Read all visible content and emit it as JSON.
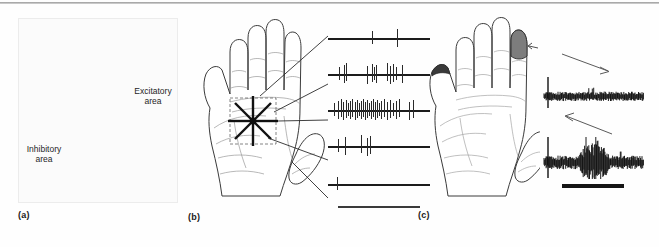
{
  "figure": {
    "panels": [
      {
        "id": "a",
        "label": "(a)",
        "description": "cat forelimb with excitatory and inhibitory receptive field areas",
        "annotations": [
          {
            "name": "excitatory-area-label",
            "text_line1": "Excitatory",
            "text_line2": "area"
          },
          {
            "name": "inhibitory-area-label",
            "text_line1": "Inhibitory",
            "text_line2": "area"
          }
        ],
        "colors": {
          "excitatory_fill": "#3b3b3b",
          "inhibitory_fill": "#ffffff",
          "outline": "#2a2a2a"
        }
      },
      {
        "id": "b",
        "label": "(b)",
        "description": "human hand palm with eight-direction stroking star over palm receptive field, linked to five spike trains",
        "star_rays": 8,
        "colors": {
          "outline": "#3a3a3a",
          "star": "#111111",
          "dashed_box": "#555555"
        }
      },
      {
        "id": "c",
        "label": "(c)",
        "description": "human hand palm with shaded receptive field on index fingertip",
        "colors": {
          "receptive_field_fill": "#7d7d7d",
          "outline": "#3a3a3a"
        }
      }
    ]
  },
  "chart_data": {
    "type": "scatter",
    "xlabel": "",
    "ylabel": "",
    "grid": false,
    "legend_position": "none",
    "spike_trains": {
      "axis_note": "x positions are percent of trace width; each trace is one stroking direction",
      "traces": [
        {
          "name": "trace-1",
          "direction": "diagonal-1",
          "spike_count": 2,
          "spikes": [
            43,
            68
          ]
        },
        {
          "name": "trace-2",
          "direction": "diagonal-2",
          "spike_count": 12,
          "spikes": [
            11,
            16,
            18,
            38,
            43,
            45,
            47,
            58,
            61,
            64,
            67,
            73
          ]
        },
        {
          "name": "trace-3",
          "direction": "preferred",
          "spike_count": 30,
          "spikes": [
            6,
            10,
            13,
            15,
            18,
            20,
            22,
            24,
            26,
            28,
            30,
            32,
            34,
            36,
            38,
            40,
            42,
            44,
            46,
            48,
            50,
            52,
            55,
            58,
            61,
            64,
            67,
            70,
            79,
            83
          ]
        },
        {
          "name": "trace-4",
          "direction": "diagonal-3",
          "spike_count": 5,
          "spikes": [
            10,
            17,
            32,
            38,
            41
          ]
        },
        {
          "name": "trace-5",
          "direction": "null",
          "spike_count": 1,
          "spikes": [
            9
          ]
        }
      ],
      "scalebar": {
        "name": "spike-train-scalebar",
        "label": ""
      }
    },
    "emg_traces": [
      {
        "name": "emg-trace-distal",
        "direction_arrow": "down-right",
        "burst": false,
        "baseline_amplitude": 0.3,
        "peak_amplitude": 1.0,
        "description": "stroking toward distal: sparse, low amplitude response"
      },
      {
        "name": "emg-trace-proximal",
        "direction_arrow": "up-left",
        "burst": true,
        "burst_start_pct": 34,
        "burst_end_pct": 66,
        "baseline_amplitude": 0.34,
        "peak_amplitude": 1.0,
        "description": "stroking toward proximal: strong high amplitude burst"
      }
    ],
    "emg_scalebar": {
      "name": "emg-stimulus-bar",
      "label": ""
    }
  }
}
